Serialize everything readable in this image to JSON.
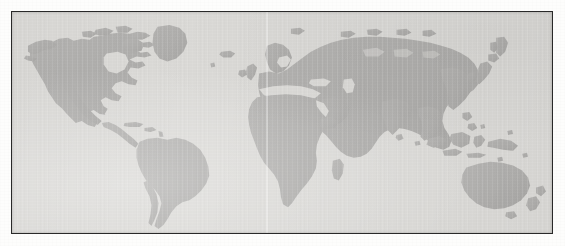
{
  "figure": {
    "kind": "world-map",
    "projection": "equirectangular",
    "has_labels": false,
    "has_graticule": false,
    "frame": {
      "visible": true,
      "border_color": "#2a2a2a",
      "border_width_px": 1.5,
      "left_px": 11,
      "top_px": 11,
      "width_px": 542,
      "height_px": 223
    },
    "colors": {
      "page_background": "#fdfdfc",
      "ocean_background": "#dcdbd8",
      "land_fill": "#b3b2b0",
      "land_fill_dark": "#aaa9a7",
      "border": "#2a2a2a",
      "scan_streak": "#f2f2f0"
    },
    "artifacts": {
      "vertical_scan_streak": "faint lighter vertical band near horizontal center",
      "paper_grain": "light speckled scanner noise across the plate"
    }
  },
  "landmasses": [
    {
      "name": "North America",
      "label": "north-america"
    },
    {
      "name": "Greenland",
      "label": "greenland"
    },
    {
      "name": "Canadian Arctic Archipelago",
      "label": "canadian-arctic-archipelago"
    },
    {
      "name": "Central America",
      "label": "central-america"
    },
    {
      "name": "Caribbean",
      "label": "caribbean"
    },
    {
      "name": "South America",
      "label": "south-america"
    },
    {
      "name": "Europe",
      "label": "europe"
    },
    {
      "name": "British Isles",
      "label": "british-isles"
    },
    {
      "name": "Scandinavia",
      "label": "scandinavia"
    },
    {
      "name": "Iceland",
      "label": "iceland"
    },
    {
      "name": "Africa",
      "label": "africa"
    },
    {
      "name": "Madagascar",
      "label": "madagascar"
    },
    {
      "name": "Arabian Peninsula",
      "label": "arabian-peninsula"
    },
    {
      "name": "Asia",
      "label": "asia"
    },
    {
      "name": "Siberia",
      "label": "siberia"
    },
    {
      "name": "India",
      "label": "india"
    },
    {
      "name": "Japan",
      "label": "japan"
    },
    {
      "name": "Indonesia",
      "label": "indonesia"
    },
    {
      "name": "Philippines",
      "label": "philippines"
    },
    {
      "name": "New Guinea",
      "label": "new-guinea"
    },
    {
      "name": "Australia",
      "label": "australia"
    },
    {
      "name": "New Zealand",
      "label": "new-zealand"
    }
  ]
}
